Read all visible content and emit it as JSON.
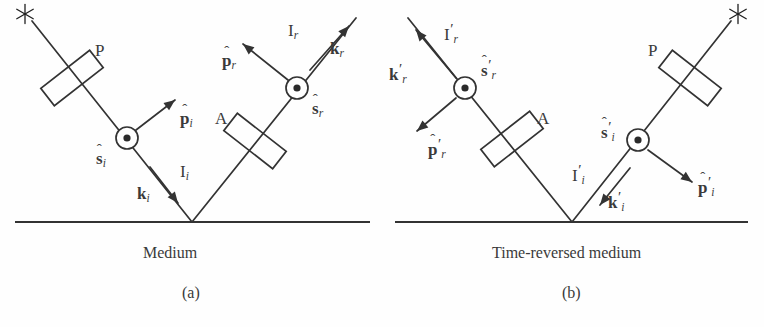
{
  "figure": {
    "domain": "diagram",
    "stroke_color": "#333333",
    "background_color": "#ffffff",
    "text_color": "#3a3a3a",
    "width": 764,
    "height": 327
  },
  "panels": [
    {
      "id": "a",
      "panel_label": "(a)",
      "panel_label_pos": {
        "x": 182,
        "y": 285
      },
      "medium_label": "Medium",
      "medium_label_pos": {
        "x": 143,
        "y": 245
      },
      "ground": {
        "x1": 15,
        "y1": 222,
        "x2": 370,
        "y2": 222
      },
      "vertex": {
        "x": 192,
        "y": 222
      },
      "source": {
        "name": "asterisk-source",
        "x": 25,
        "y": 14,
        "glyph": "*"
      },
      "optics": [
        {
          "name": "polarizer",
          "label": "P",
          "cx": 72,
          "cy": 78,
          "angle": -38,
          "w": 62,
          "h": 22,
          "label_pos": {
            "x": 95,
            "y": 42
          }
        },
        {
          "name": "analyzer",
          "label": "A",
          "cx": 255,
          "cy": 141,
          "angle": 38,
          "w": 62,
          "h": 22,
          "label_pos": {
            "x": 215,
            "y": 110
          }
        }
      ],
      "nodes": [
        {
          "name": "s-hat-i",
          "cx": 127,
          "cy": 138,
          "r": 11,
          "label": "s",
          "hat": true,
          "sub": "i",
          "prime": false,
          "label_pos": {
            "x": 96,
            "y": 150
          }
        },
        {
          "name": "s-hat-r",
          "cx": 297,
          "cy": 88,
          "r": 11,
          "label": "s",
          "hat": true,
          "sub": "r",
          "prime": false,
          "label_pos": {
            "x": 312,
            "y": 100
          }
        }
      ],
      "beams": [
        {
          "name": "incident-beam",
          "x1": 32,
          "y1": 21,
          "x2": 192,
          "y2": 222
        },
        {
          "name": "reflected-beam",
          "x1": 192,
          "y1": 222,
          "x2": 356,
          "y2": 18
        }
      ],
      "arrows": [
        {
          "name": "p-hat-i-arrow",
          "x1": 136,
          "y1": 130,
          "x2": 175,
          "y2": 100,
          "label": "p",
          "hat": true,
          "sub": "i",
          "prime": false,
          "bold": true,
          "label_pos": {
            "x": 180,
            "y": 110
          }
        },
        {
          "name": "p-hat-r-arrow",
          "x1": 288,
          "y1": 80,
          "x2": 243,
          "y2": 44,
          "label": "p",
          "hat": true,
          "sub": "r",
          "prime": false,
          "bold": true,
          "label_pos": {
            "x": 222,
            "y": 52
          }
        },
        {
          "name": "k-i-arrow",
          "x1": 150,
          "y1": 167,
          "x2": 178,
          "y2": 203,
          "label": "k",
          "hat": false,
          "sub": "i",
          "prime": false,
          "bold": true,
          "label_pos": {
            "x": 137,
            "y": 185
          }
        },
        {
          "name": "k-r-arrow",
          "x1": 310,
          "y1": 70,
          "x2": 349,
          "y2": 26,
          "label": "k",
          "hat": false,
          "sub": "r",
          "prime": false,
          "bold": true,
          "label_pos": {
            "x": 330,
            "y": 40
          }
        }
      ],
      "ray_labels": [
        {
          "name": "intensity-incident",
          "text": "I",
          "sub": "i",
          "prime": false,
          "x": 180,
          "y": 163
        },
        {
          "name": "intensity-reflected",
          "text": "I",
          "sub": "r",
          "prime": false,
          "x": 288,
          "y": 22
        }
      ]
    },
    {
      "id": "b",
      "panel_label": "(b)",
      "panel_label_pos": {
        "x": 562,
        "y": 285
      },
      "medium_label": "Time-reversed medium",
      "medium_label_pos": {
        "x": 492,
        "y": 245
      },
      "ground": {
        "x1": 395,
        "y1": 222,
        "x2": 748,
        "y2": 222
      },
      "vertex": {
        "x": 572,
        "y": 222
      },
      "source": {
        "name": "asterisk-source",
        "x": 738,
        "y": 14,
        "glyph": "*"
      },
      "optics": [
        {
          "name": "analyzer",
          "label": "A",
          "cx": 512,
          "cy": 139,
          "angle": -38,
          "w": 62,
          "h": 22,
          "label_pos": {
            "x": 537,
            "y": 110
          }
        },
        {
          "name": "polarizer",
          "label": "P",
          "cx": 690,
          "cy": 78,
          "angle": 38,
          "w": 62,
          "h": 22,
          "label_pos": {
            "x": 648,
            "y": 42
          }
        }
      ],
      "nodes": [
        {
          "name": "s-hat-r-prime",
          "cx": 465,
          "cy": 88,
          "r": 11,
          "label": "s",
          "hat": true,
          "sub": "r",
          "prime": true,
          "label_pos": {
            "x": 481,
            "y": 58
          }
        },
        {
          "name": "s-hat-i-prime",
          "cx": 638,
          "cy": 140,
          "r": 11,
          "label": "s",
          "hat": true,
          "sub": "i",
          "prime": true,
          "label_pos": {
            "x": 601,
            "y": 120
          }
        }
      ],
      "beams": [
        {
          "name": "outgoing-beam",
          "x1": 572,
          "y1": 222,
          "x2": 408,
          "y2": 18
        },
        {
          "name": "incoming-beam",
          "x1": 731,
          "y1": 21,
          "x2": 572,
          "y2": 222
        }
      ],
      "arrows": [
        {
          "name": "k-r-prime-arrow",
          "x1": 456,
          "y1": 78,
          "x2": 416,
          "y2": 30,
          "label": "k",
          "hat": false,
          "sub": "r",
          "prime": true,
          "bold": true,
          "label_pos": {
            "x": 389,
            "y": 62
          }
        },
        {
          "name": "p-hat-r-prime-arrow",
          "x1": 456,
          "y1": 98,
          "x2": 417,
          "y2": 131,
          "label": "p",
          "hat": true,
          "sub": "r",
          "prime": true,
          "bold": true,
          "label_pos": {
            "x": 428,
            "y": 137
          }
        },
        {
          "name": "p-hat-i-prime-arrow",
          "x1": 648,
          "y1": 150,
          "x2": 692,
          "y2": 182,
          "label": "p",
          "hat": true,
          "sub": "i",
          "prime": true,
          "bold": true,
          "label_pos": {
            "x": 698,
            "y": 175
          }
        },
        {
          "name": "k-i-prime-arrow",
          "x1": 630,
          "y1": 168,
          "x2": 600,
          "y2": 205,
          "label": "k",
          "hat": false,
          "sub": "i",
          "prime": true,
          "bold": true,
          "label_pos": {
            "x": 608,
            "y": 190
          }
        }
      ],
      "ray_labels": [
        {
          "name": "intensity-reflected-prime",
          "text": "I",
          "sub": "r",
          "prime": true,
          "x": 444,
          "y": 22
        },
        {
          "name": "intensity-incident-prime",
          "text": "I",
          "sub": "i",
          "prime": true,
          "x": 572,
          "y": 163
        }
      ]
    }
  ]
}
